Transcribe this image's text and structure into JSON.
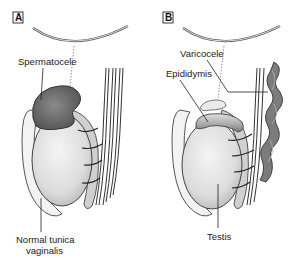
{
  "figure": {
    "panels": [
      {
        "id": "A",
        "letter": "A",
        "labels": {
          "spermatocele": "Spermatocele",
          "tunica_line1": "Normal tunica",
          "tunica_line2": "vaginalis"
        }
      },
      {
        "id": "B",
        "letter": "B",
        "labels": {
          "varicocele": "Varicocele",
          "epididymis": "Epididymis",
          "testis": "Testis"
        }
      }
    ],
    "colors": {
      "outline": "#3a3a3a",
      "spermatocele_fill": "#6e6e6e",
      "testis_fill": "#e4e4e4",
      "tunica_fill": "#f2f2f2",
      "varicocele_fill": "#7a7a7a",
      "epididymis_fill": "#bdbdbd"
    }
  }
}
